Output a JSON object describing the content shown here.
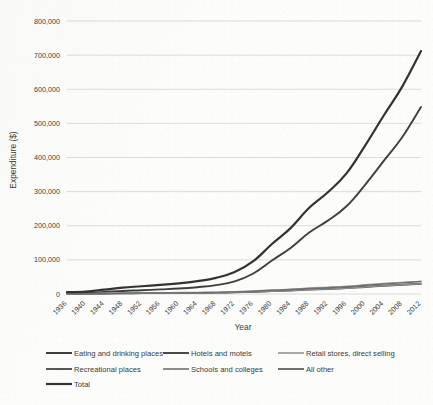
{
  "chart_data": {
    "type": "line",
    "title": "",
    "xlabel": "Year",
    "ylabel": "Expenditure ($)",
    "grid": "horizontal",
    "legend_position": "bottom",
    "xlim": [
      1936,
      2012
    ],
    "ylim": [
      0,
      800000
    ],
    "ytick_labels": [
      "0",
      "100,000",
      "200,000",
      "300,000",
      "400,000",
      "500,000",
      "600,000",
      "700,000",
      "800,000"
    ],
    "ytick_values": [
      0,
      100000,
      200000,
      300000,
      400000,
      500000,
      600000,
      700000,
      800000
    ],
    "xtick_labels": [
      "1936",
      "1940",
      "1944",
      "1948",
      "1952",
      "1956",
      "1960",
      "1964",
      "1968",
      "1972",
      "1976",
      "1980",
      "1984",
      "1988",
      "1992",
      "1996",
      "2000",
      "2004",
      "2008",
      "2012"
    ],
    "x": [
      1936,
      1940,
      1944,
      1948,
      1952,
      1956,
      1960,
      1964,
      1968,
      1972,
      1976,
      1980,
      1984,
      1988,
      1992,
      1996,
      2000,
      2004,
      2008,
      2012
    ],
    "series": [
      {
        "name": "Eating and drinking places",
        "color": "#3f3f3f",
        "width": 1.9,
        "values": [
          2200,
          3000,
          6000,
          9000,
          11000,
          13500,
          16000,
          20000,
          26000,
          37000,
          60000,
          98000,
          135000,
          180000,
          215000,
          257000,
          320000,
          390000,
          460000,
          548000
        ]
      },
      {
        "name": "Hotels and  motels",
        "color": "#4a4a4a",
        "width": 1.4,
        "values": [
          600,
          700,
          1300,
          1900,
          2200,
          2500,
          2800,
          3300,
          4000,
          5200,
          7000,
          9500,
          11500,
          14500,
          16000,
          18500,
          22000,
          25000,
          28000,
          31000
        ]
      },
      {
        "name": "Retail stores, direct selling",
        "color": "#a8a8a8",
        "width": 1.4,
        "values": [
          900,
          1100,
          2000,
          2900,
          3400,
          3800,
          4200,
          4800,
          5600,
          7000,
          9000,
          12000,
          14000,
          17500,
          20000,
          23000,
          27000,
          31000,
          34000,
          37000
        ]
      },
      {
        "name": "Recreational places",
        "color": "#555555",
        "width": 1.4,
        "values": [
          400,
          500,
          900,
          1400,
          1700,
          2000,
          2300,
          2700,
          3300,
          4300,
          5800,
          7800,
          9500,
          12000,
          14000,
          16500,
          20000,
          23500,
          26500,
          29500
        ]
      },
      {
        "name": "Schools and colleges",
        "color": "#8c8c8c",
        "width": 1.4,
        "values": [
          500,
          600,
          1000,
          1500,
          1800,
          2100,
          2400,
          2900,
          3600,
          4700,
          6200,
          8200,
          10000,
          12500,
          14500,
          17000,
          20500,
          24000,
          27000,
          30000
        ]
      },
      {
        "name": "All other",
        "color": "#6e6e6e",
        "width": 1.4,
        "values": [
          700,
          900,
          1500,
          2200,
          2600,
          3000,
          3400,
          4000,
          4800,
          6200,
          8200,
          11000,
          13000,
          16000,
          18500,
          21500,
          25500,
          29500,
          33000,
          36500
        ]
      },
      {
        "name": "Total",
        "color": "#333333",
        "width": 2.2,
        "values": [
          5300,
          6800,
          12700,
          18900,
          22700,
          26900,
          31100,
          37700,
          47300,
          64400,
          96200,
          146500,
          193000,
          252500,
          298000,
          353500,
          435000,
          523000,
          608500,
          712000
        ]
      }
    ],
    "peak_total_2012": 730000,
    "peak_eating_2012": 550000
  },
  "legend": {
    "rows": [
      [
        "Eating and drinking places",
        "Hotels and  motels",
        "Retail stores, direct selling"
      ],
      [
        "Recreational places",
        "Schools and colleges",
        "All other"
      ],
      [
        "Total"
      ]
    ]
  }
}
